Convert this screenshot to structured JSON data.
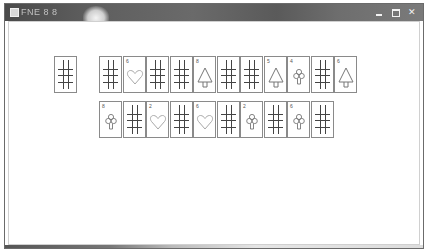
{
  "window": {
    "title": "FNE 8 8",
    "controls": [
      "minimize",
      "maximize",
      "close"
    ]
  },
  "deck": {
    "face": "down"
  },
  "rows": [
    {
      "cards": [
        {
          "face": "down"
        },
        {
          "face": "up",
          "rank": "6",
          "suit": "heart"
        },
        {
          "face": "down"
        },
        {
          "face": "down"
        },
        {
          "face": "up",
          "rank": "8",
          "suit": "spade"
        },
        {
          "face": "down"
        },
        {
          "face": "down"
        },
        {
          "face": "up",
          "rank": "5",
          "suit": "spade"
        },
        {
          "face": "up",
          "rank": "4",
          "suit": "club"
        },
        {
          "face": "down"
        },
        {
          "face": "up",
          "rank": "6",
          "suit": "spade"
        }
      ]
    },
    {
      "cards": [
        {
          "face": "up",
          "rank": "8",
          "suit": "club"
        },
        {
          "face": "down"
        },
        {
          "face": "up",
          "rank": "2",
          "suit": "heart"
        },
        {
          "face": "down"
        },
        {
          "face": "up",
          "rank": "6",
          "suit": "heart"
        },
        {
          "face": "down"
        },
        {
          "face": "up",
          "rank": "2",
          "suit": "club"
        },
        {
          "face": "down"
        },
        {
          "face": "up",
          "rank": "6",
          "suit": "club"
        },
        {
          "face": "down"
        }
      ]
    }
  ],
  "colors": {
    "titlebar": "#5e5e5e",
    "card_border": "#8a8a8a",
    "grid_lines": "#444444",
    "suit_outline": "#999999"
  }
}
